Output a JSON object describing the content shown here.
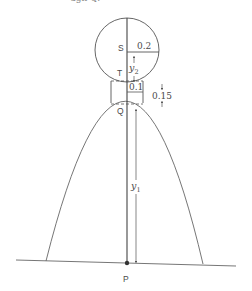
{
  "caption": {
    "partial_text": "ugh Q."
  },
  "labels": {
    "S": "S",
    "T": "T",
    "Q": "Q",
    "P": "P",
    "radius": "0.2",
    "neck_half_width": "0.1",
    "neck_height": "0.15",
    "y2": "y",
    "y2_sub": "2",
    "y1": "y",
    "y1_sub": "1"
  },
  "colors": {
    "stroke": "#555555",
    "text": "#4a4a4a",
    "background": "#ffffff"
  }
}
